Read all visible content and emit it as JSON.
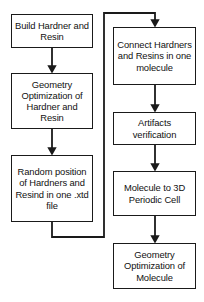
{
  "diagram": {
    "type": "flowchart",
    "background_color": "#ffffff",
    "line_color": "#1a1a1a",
    "text_color": "#111111"
  },
  "nodes": {
    "build_hardner_resin": {
      "label": "Build Hardner and Resin"
    },
    "geometry_optimization_hardner_resin": {
      "label": "Geometry Optimization of Hardner and Resin"
    },
    "random_position": {
      "label": "Random position of Hardners and Resind in one .xtd file"
    },
    "connect_hardners_resins": {
      "label": "Connect Hardners and Resins in one molecule"
    },
    "artifacts_verification": {
      "label": "Artifacts verification"
    },
    "molecule_to_3d_cell": {
      "label": "Molecule to 3D Periodic Cell"
    },
    "geometry_optimization_molecule": {
      "label": "Geometry Optimization of Molecule"
    }
  },
  "edges": [
    {
      "from": "build_hardner_resin",
      "to": "geometry_optimization_hardner_resin",
      "style": "arrow-down"
    },
    {
      "from": "geometry_optimization_hardner_resin",
      "to": "random_position",
      "style": "arrow-down"
    },
    {
      "from": "random_position",
      "to": "connect_hardners_resins",
      "style": "elbow-feedback-arrow"
    },
    {
      "from": "connect_hardners_resins",
      "to": "artifacts_verification",
      "style": "arrow-down"
    },
    {
      "from": "artifacts_verification",
      "to": "molecule_to_3d_cell",
      "style": "arrow-down"
    },
    {
      "from": "molecule_to_3d_cell",
      "to": "geometry_optimization_molecule",
      "style": "arrow-down"
    }
  ]
}
